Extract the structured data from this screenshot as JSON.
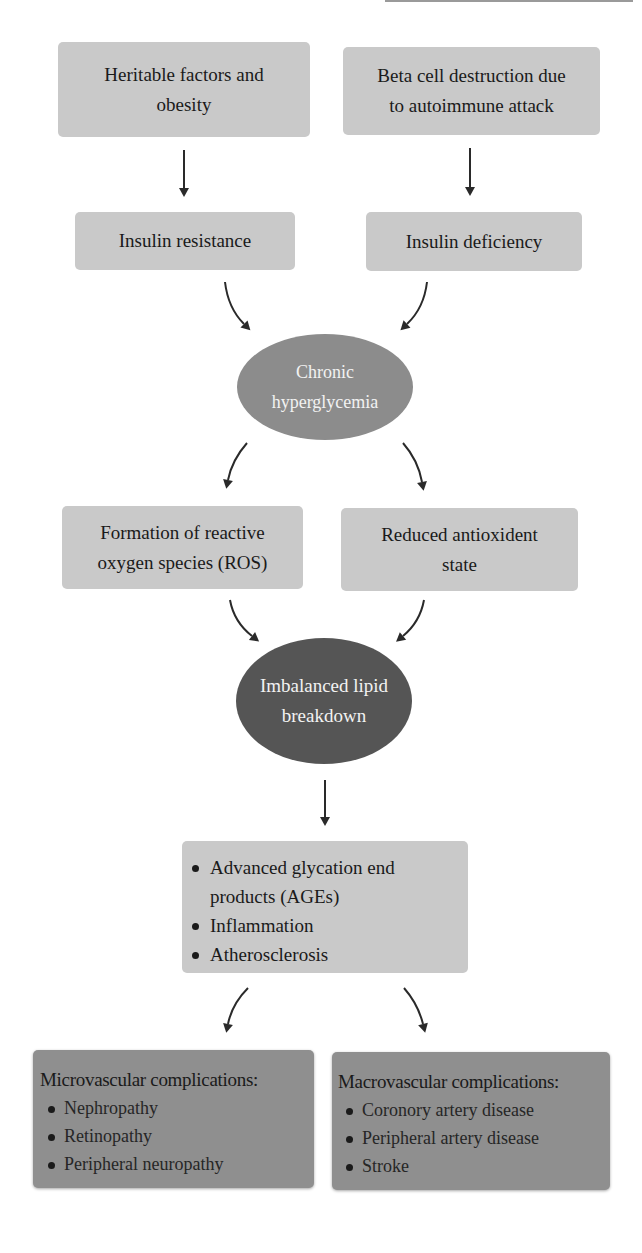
{
  "diagram": {
    "nodes": {
      "heritable": {
        "text": "Heritable factors and obesity",
        "lines": [
          "Heritable factors and",
          "obesity"
        ]
      },
      "beta_cell": {
        "text": "Beta cell destruction due to autoimmune attack",
        "lines": [
          "Beta cell destruction due",
          "to autoimmune attack"
        ]
      },
      "insulin_resistance": {
        "text": "Insulin resistance"
      },
      "insulin_deficiency": {
        "text": "Insulin deficiency"
      },
      "hyperglycemia": {
        "text": "Chronic hyperglycemia",
        "lines": [
          "Chronic",
          "hyperglycemia"
        ]
      },
      "ros": {
        "text": "Formation of reactive oxygen species (ROS)",
        "lines": [
          "Formation of reactive",
          "oxygen species (ROS)"
        ]
      },
      "antioxidant": {
        "text": "Reduced antioxident state",
        "lines": [
          "Reduced antioxident",
          "state"
        ]
      },
      "lipid": {
        "text": "Imbalanced lipid breakdown",
        "lines": [
          "Imbalanced lipid",
          "breakdown"
        ]
      },
      "outcomes": {
        "items": [
          "Advanced glycation end products (AGEs)",
          "Inflammation",
          "Atherosclerosis"
        ]
      },
      "microvascular": {
        "title": "Microvascular complications:",
        "items": [
          "Nephropathy",
          "Retinopathy",
          "Peripheral neuropathy"
        ]
      },
      "macrovascular": {
        "title": "Macrovascular complications:",
        "items": [
          "Coronory artery disease",
          "Peripheral artery disease",
          "Stroke"
        ]
      }
    },
    "edges": [
      {
        "from": "heritable",
        "to": "insulin_resistance"
      },
      {
        "from": "beta_cell",
        "to": "insulin_deficiency"
      },
      {
        "from": "insulin_resistance",
        "to": "hyperglycemia"
      },
      {
        "from": "insulin_deficiency",
        "to": "hyperglycemia"
      },
      {
        "from": "hyperglycemia",
        "to": "ros"
      },
      {
        "from": "hyperglycemia",
        "to": "antioxidant"
      },
      {
        "from": "ros",
        "to": "lipid"
      },
      {
        "from": "antioxidant",
        "to": "lipid"
      },
      {
        "from": "lipid",
        "to": "outcomes"
      },
      {
        "from": "outcomes",
        "to": "microvascular"
      },
      {
        "from": "outcomes",
        "to": "macrovascular"
      }
    ],
    "colors": {
      "box_light": "#c9c9c9",
      "box_dark": "#8f8f8f",
      "ellipse_medium": "#8c8c8c",
      "ellipse_dark": "#555555",
      "arrow": "#2a2a2a"
    }
  }
}
